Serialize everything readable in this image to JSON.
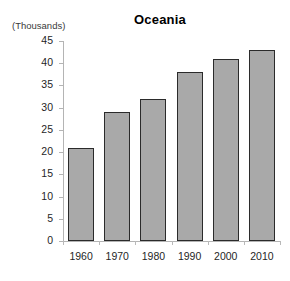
{
  "chart_data": {
    "type": "bar",
    "title": "Oceania",
    "xlabel": "",
    "ylabel": "(Thousands)",
    "categories": [
      "1960",
      "1970",
      "1980",
      "1990",
      "2000",
      "2010"
    ],
    "values": [
      21,
      29,
      32,
      38,
      41,
      43
    ],
    "ylim": [
      0,
      45
    ],
    "ytick_labels": [
      "0",
      "5",
      "10",
      "15",
      "20",
      "25",
      "30",
      "35",
      "40",
      "45"
    ],
    "ytick_values": [
      0,
      5,
      10,
      15,
      20,
      25,
      30,
      35,
      40,
      45
    ],
    "grid": false,
    "legend": "none",
    "series": [
      {
        "name": "Oceania",
        "values": [
          21,
          29,
          32,
          38,
          41,
          43
        ]
      }
    ],
    "colors": {
      "bar_fill": "#a9a9a9",
      "bar_border": "#2b2b2b",
      "axis": "#b4b4b4",
      "text": "#1f1f1f",
      "background": "#ffffff"
    }
  }
}
